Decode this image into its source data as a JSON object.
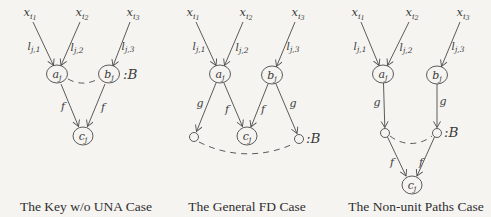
{
  "colors": {
    "background": "#f5f4f1",
    "ink": "#3b3b3b"
  },
  "panels": [
    {
      "id": "key-wo-una",
      "caption": "The Key w/o UNA Case",
      "inputs": [
        {
          "base": "x",
          "sub": "i",
          "subsub": "1"
        },
        {
          "base": "x",
          "sub": "i",
          "subsub": "2"
        },
        {
          "base": "x",
          "sub": "i",
          "subsub": "3"
        }
      ],
      "input_edge_labels": [
        {
          "base": "l",
          "sub": "j,1"
        },
        {
          "base": "l",
          "sub": "j,2"
        },
        {
          "base": "l",
          "sub": "j,3"
        }
      ],
      "nodes": {
        "a": {
          "base": "a",
          "sub": "j"
        },
        "b": {
          "base": "b",
          "sub": "j"
        },
        "c": {
          "base": "c",
          "sub": "j"
        }
      },
      "b_annotation": ":B",
      "edge_labels": {
        "af": "f",
        "bf": "f"
      }
    },
    {
      "id": "general-fd",
      "caption": "The General FD Case",
      "inputs": [
        {
          "base": "x",
          "sub": "i",
          "subsub": "1"
        },
        {
          "base": "x",
          "sub": "i",
          "subsub": "2"
        },
        {
          "base": "x",
          "sub": "i",
          "subsub": "3"
        }
      ],
      "input_edge_labels": [
        {
          "base": "l",
          "sub": "j,1"
        },
        {
          "base": "l",
          "sub": "j,2"
        },
        {
          "base": "l",
          "sub": "j,3"
        }
      ],
      "nodes": {
        "a": {
          "base": "a",
          "sub": "j"
        },
        "b": {
          "base": "b",
          "sub": "j"
        },
        "c": {
          "base": "c",
          "sub": "j"
        }
      },
      "b_annotation": ":B",
      "edge_labels": {
        "ag": "g",
        "af": "f",
        "bf": "f",
        "bg": "g"
      }
    },
    {
      "id": "non-unit-paths",
      "caption": "The Non-unit Paths Case",
      "inputs": [
        {
          "base": "x",
          "sub": "i",
          "subsub": "1"
        },
        {
          "base": "x",
          "sub": "i",
          "subsub": "2"
        },
        {
          "base": "x",
          "sub": "i",
          "subsub": "3"
        }
      ],
      "input_edge_labels": [
        {
          "base": "l",
          "sub": "j,1"
        },
        {
          "base": "l",
          "sub": "j,2"
        },
        {
          "base": "l",
          "sub": "j,3"
        }
      ],
      "nodes": {
        "a": {
          "base": "a",
          "sub": "j"
        },
        "b": {
          "base": "b",
          "sub": "j"
        },
        "c": {
          "base": "c",
          "sub": "j"
        }
      },
      "b_annotation": ":B",
      "edge_labels": {
        "ag": "g",
        "bg": "g",
        "lf": "f",
        "rf": "f"
      }
    }
  ]
}
